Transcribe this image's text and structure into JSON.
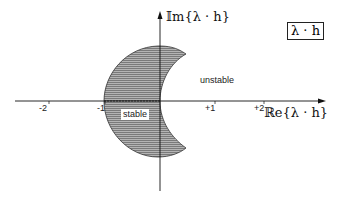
{
  "figure": {
    "title_box": "λ · h",
    "y_axis_label": "𝕀m{λ · h}",
    "x_axis_label": "ℝe{λ · h}",
    "x_ticks": [
      "-2",
      "-1",
      "+1",
      "+2"
    ],
    "regions": {
      "stable": "stable",
      "unstable": "unstable"
    },
    "colors": {
      "axis": "#111111",
      "fill": "#9a9a9a",
      "outline": "#333333",
      "background": "#ffffff"
    }
  }
}
